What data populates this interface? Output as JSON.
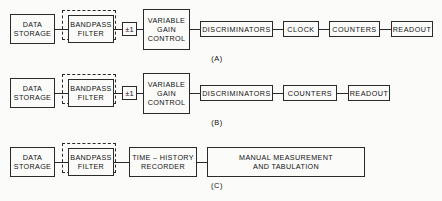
{
  "diagram": {
    "colors": {
      "background": "#fbfbfa",
      "line": "#2a2a2a",
      "text": "#121212"
    },
    "rows": [
      {
        "id": "row-a",
        "caption": "(A)",
        "blocks": [
          {
            "name": "data-storage",
            "lines": [
              "DATA",
              "STORAGE"
            ]
          },
          {
            "name": "bandpass-filter",
            "lines": [
              "BANDPASS",
              "FILTER"
            ],
            "dashed_enclosure": true
          },
          {
            "name": "polarity-unit",
            "lines": [
              "±1"
            ]
          },
          {
            "name": "variable-gain-control",
            "lines": [
              "VARIABLE",
              "GAIN",
              "CONTROL"
            ]
          },
          {
            "name": "discriminators",
            "lines": [
              "DISCRIMINATORS"
            ]
          },
          {
            "name": "clock",
            "lines": [
              "CLOCK"
            ]
          },
          {
            "name": "counters",
            "lines": [
              "COUNTERS"
            ]
          },
          {
            "name": "readout",
            "lines": [
              "READOUT"
            ]
          }
        ]
      },
      {
        "id": "row-b",
        "caption": "(B)",
        "blocks": [
          {
            "name": "data-storage",
            "lines": [
              "DATA",
              "STORAGE"
            ]
          },
          {
            "name": "bandpass-filter",
            "lines": [
              "BANDPASS",
              "FILTER"
            ],
            "dashed_enclosure": true
          },
          {
            "name": "polarity-unit",
            "lines": [
              "±1"
            ]
          },
          {
            "name": "variable-gain-control",
            "lines": [
              "VARIABLE",
              "GAIN",
              "CONTROL"
            ]
          },
          {
            "name": "discriminators",
            "lines": [
              "DISCRIMINATORS"
            ]
          },
          {
            "name": "counters",
            "lines": [
              "COUNTERS"
            ]
          },
          {
            "name": "readout",
            "lines": [
              "READOUT"
            ]
          }
        ]
      },
      {
        "id": "row-c",
        "caption": "(C)",
        "blocks": [
          {
            "name": "data-storage",
            "lines": [
              "DATA",
              "STORAGE"
            ]
          },
          {
            "name": "bandpass-filter",
            "lines": [
              "BANDPASS",
              "FILTER"
            ],
            "dashed_enclosure": true
          },
          {
            "name": "time-history-recorder",
            "lines": [
              "TIME – HISTORY",
              "RECORDER"
            ]
          },
          {
            "name": "manual-measurement-tabulation",
            "lines": [
              "MANUAL  MEASUREMENT",
              "AND  TABULATION"
            ]
          }
        ]
      }
    ]
  },
  "labels": {
    "a_data_storage_l1": "DATA",
    "a_data_storage_l2": "STORAGE",
    "a_bandpass_l1": "BANDPASS",
    "a_bandpass_l2": "FILTER",
    "a_polarity": "±1",
    "a_vgc_l1": "VARIABLE",
    "a_vgc_l2": "GAIN",
    "a_vgc_l3": "CONTROL",
    "a_discriminators": "DISCRIMINATORS",
    "a_clock": "CLOCK",
    "a_counters": "COUNTERS",
    "a_readout": "READOUT",
    "a_caption": "(A)",
    "b_data_storage_l1": "DATA",
    "b_data_storage_l2": "STORAGE",
    "b_bandpass_l1": "BANDPASS",
    "b_bandpass_l2": "FILTER",
    "b_polarity": "±1",
    "b_vgc_l1": "VARIABLE",
    "b_vgc_l2": "GAIN",
    "b_vgc_l3": "CONTROL",
    "b_discriminators": "DISCRIMINATORS",
    "b_counters": "COUNTERS",
    "b_readout": "READOUT",
    "b_caption": "(B)",
    "c_data_storage_l1": "DATA",
    "c_data_storage_l2": "STORAGE",
    "c_bandpass_l1": "BANDPASS",
    "c_bandpass_l2": "FILTER",
    "c_recorder_l1": "TIME – HISTORY",
    "c_recorder_l2": "RECORDER",
    "c_manual_l1": "MANUAL  MEASUREMENT",
    "c_manual_l2": "AND  TABULATION",
    "c_caption": "(C)"
  }
}
